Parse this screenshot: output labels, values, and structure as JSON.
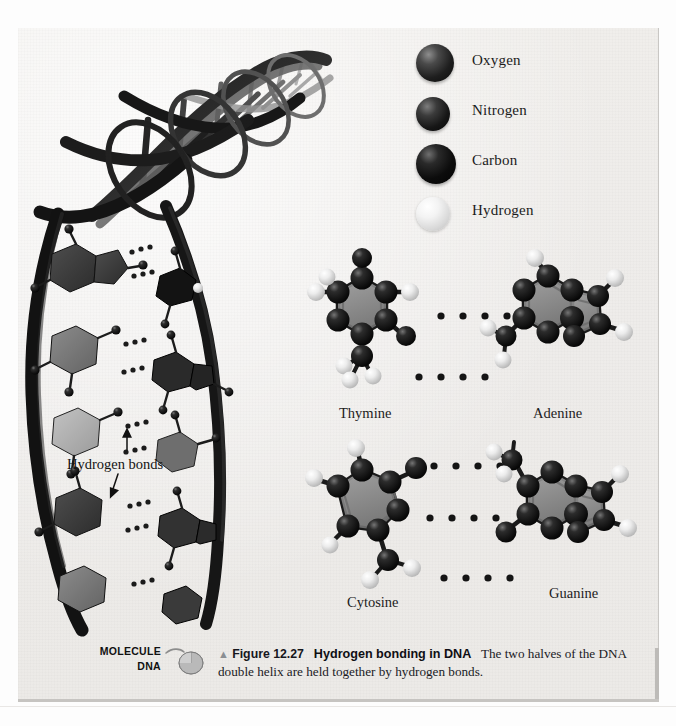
{
  "figure": {
    "legend": {
      "title": "atom-key",
      "items": [
        {
          "label": "Oxygen",
          "icon": "sphere-oxygen-icon",
          "color": "#2a2a2a"
        },
        {
          "label": "Nitrogen",
          "icon": "sphere-nitrogen-icon",
          "color": "#1e1e1e"
        },
        {
          "label": "Carbon",
          "icon": "sphere-carbon-icon",
          "color": "#0c0c0c"
        },
        {
          "label": "Hydrogen",
          "icon": "sphere-hydrogen-icon",
          "color": "#eeeeee"
        }
      ]
    },
    "annotations": {
      "hydrogen_bonds": "Hydrogen bonds"
    },
    "base_pairs": [
      {
        "left": "Thymine",
        "right": "Adenine",
        "bonds": 2
      },
      {
        "left": "Cytosine",
        "right": "Guanine",
        "bonds": 3
      }
    ],
    "labels": {
      "thymine": "Thymine",
      "adenine": "Adenine",
      "cytosine": "Cytosine",
      "guanine": "Guanine"
    },
    "caption": {
      "marker": "▲",
      "number": "Figure 12.27",
      "title": "Hydrogen bonding in DNA",
      "body": "The two halves of the DNA double helix are held together by hydrogen bonds."
    },
    "media_badge": {
      "kind": "MOLECULE",
      "name": "DNA",
      "icon": "computer-mouse-icon"
    },
    "colors": {
      "plate_background": "#eeecea",
      "ring_fill": "#8a8a8a",
      "atom_dark": "#141414",
      "atom_light": "#f0f0f0",
      "helix_ribbon": "#1b1b1b",
      "rule": "#c6c4c1"
    }
  }
}
